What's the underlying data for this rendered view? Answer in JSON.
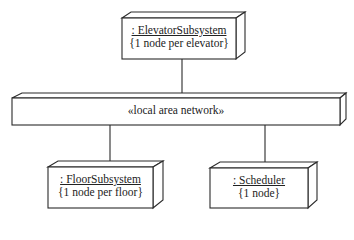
{
  "diagram": {
    "type": "UML deployment diagram",
    "nodes": [
      {
        "id": "elevator",
        "name": ": ElevatorSubsystem",
        "constraint": "{1 node per elevator}"
      },
      {
        "id": "floor",
        "name": ": FloorSubsystem",
        "constraint": "{1 node per floor}"
      },
      {
        "id": "scheduler",
        "name": ": Scheduler",
        "constraint": "{1 node}"
      }
    ],
    "network": {
      "label": "«local area network»"
    },
    "connections": [
      {
        "from": "elevator",
        "to": "network"
      },
      {
        "from": "floor",
        "to": "network"
      },
      {
        "from": "scheduler",
        "to": "network"
      }
    ],
    "colors": {
      "stroke": "#2a2a2a",
      "fill": "#ffffff",
      "text": "#222222"
    }
  }
}
